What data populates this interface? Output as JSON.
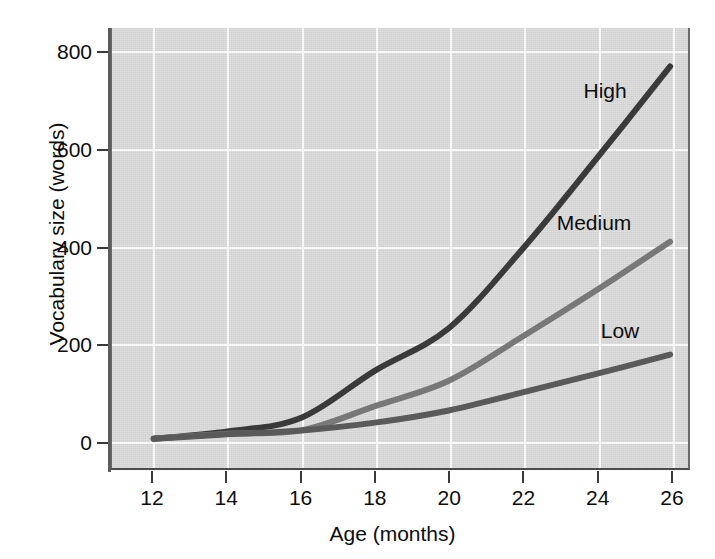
{
  "chart_data": {
    "type": "line",
    "title": "",
    "subtitle": "",
    "xlabel": "Age (months)",
    "ylabel": "Vocabulary size (words)",
    "x": [
      12,
      14,
      16,
      18,
      20,
      22,
      24,
      26
    ],
    "xticks": [
      "12",
      "14",
      "16",
      "18",
      "20",
      "22",
      "24",
      "26"
    ],
    "yticks": [
      "0",
      "200",
      "400",
      "600",
      "800"
    ],
    "ytick_values": [
      0,
      200,
      400,
      600,
      800
    ],
    "xlim": [
      12,
      26
    ],
    "ylim": [
      0,
      800
    ],
    "grid": true,
    "legend_position": "inline-annotations",
    "series": [
      {
        "name": "High",
        "color": "#3a3a3a",
        "values": [
          5,
          20,
          48,
          145,
          232,
          395,
          580,
          770
        ],
        "label_x": 24.2,
        "label_y": 720
      },
      {
        "name": "Medium",
        "color": "#787878",
        "values": [
          5,
          15,
          22,
          72,
          124,
          215,
          310,
          410
        ],
        "label_x": 23.9,
        "label_y": 450
      },
      {
        "name": "Low",
        "color": "#5a5a5a",
        "values": [
          5,
          14,
          22,
          38,
          63,
          100,
          138,
          178
        ],
        "label_x": 24.6,
        "label_y": 230
      }
    ]
  },
  "annotations": {
    "high": "High",
    "medium": "Medium",
    "low": "Low"
  },
  "axes": {
    "x_title": "Age (months)",
    "y_title": "Vocabulary size (words)"
  }
}
